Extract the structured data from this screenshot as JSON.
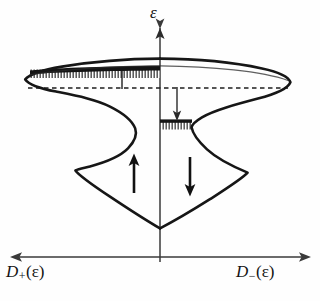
{
  "figure": {
    "kind": "spin-split-density-of-states",
    "background_color": "#fefefe",
    "curve_color": "#161616",
    "fill_color": "#1a1a1a",
    "axis_color": "#3a3a3a",
    "dashed_line_color": "#1e1e1e"
  },
  "axes": {
    "vertical": {
      "name": "energy-axis",
      "label_symbol": "ε",
      "label_full": "ε",
      "direction": "up",
      "x": 160,
      "y_top": 25,
      "y_bottom": 262
    },
    "horizontal": {
      "name": "dos-axis",
      "direction": "both",
      "y": 257,
      "x_left": 10,
      "x_right": 311,
      "left_label": {
        "symbol": "D",
        "subscript": "+",
        "argument": "(ε)",
        "text": "D₊(ε)"
      },
      "right_label": {
        "symbol": "D",
        "subscript": "−",
        "argument": "(ε)",
        "text": "D₋(ε)"
      }
    }
  },
  "annotations": {
    "fermi_level": {
      "name": "fermi-level-dashed-line",
      "style": "dashed",
      "y": 88,
      "x_start": 28,
      "x_end": 288
    },
    "spin_up_arrow": {
      "name": "spin-up-arrow",
      "direction": "up",
      "x": 134,
      "y_tail": 193,
      "y_head": 155
    },
    "spin_down_arrow": {
      "name": "spin-down-arrow",
      "direction": "down",
      "x": 190,
      "y_tail": 157,
      "y_head": 195
    },
    "transfer_arrow_left": {
      "name": "band-shift-tick-left",
      "direction": "up",
      "x": 122,
      "y_tail": 89,
      "y_head": 71
    },
    "transfer_arrow_right": {
      "name": "electron-transfer-arrow",
      "direction": "down",
      "x": 177,
      "y_tail": 88,
      "y_head": 122
    }
  },
  "filled_bands": [
    {
      "name": "filled-band-spin-up",
      "side": "left",
      "x_start": 30,
      "x_end": 160,
      "y_top": 68,
      "y_bottom": 76,
      "hatch": "vertical-ticks"
    },
    {
      "name": "filled-band-spin-down",
      "side": "right",
      "x_start": 160,
      "x_end": 192,
      "y_top": 120,
      "y_bottom": 128,
      "hatch": "vertical-ticks"
    }
  ],
  "curves": {
    "upper_lobe": {
      "name": "upper-lobe-outline",
      "left_tip": [
        25,
        80
      ],
      "right_tip": [
        290,
        84
      ],
      "apex": [
        168,
        59
      ]
    },
    "lower_lobe": {
      "name": "lower-lobe-outline",
      "left_extreme": [
        75,
        170
      ],
      "right_extreme": [
        248,
        173
      ],
      "bottom_vertex": [
        160,
        228
      ]
    },
    "waist_left": {
      "name": "left-curve-waist",
      "x": 135,
      "y": 118
    },
    "waist_right": {
      "name": "right-curve-waist",
      "x": 192,
      "y": 122
    }
  }
}
